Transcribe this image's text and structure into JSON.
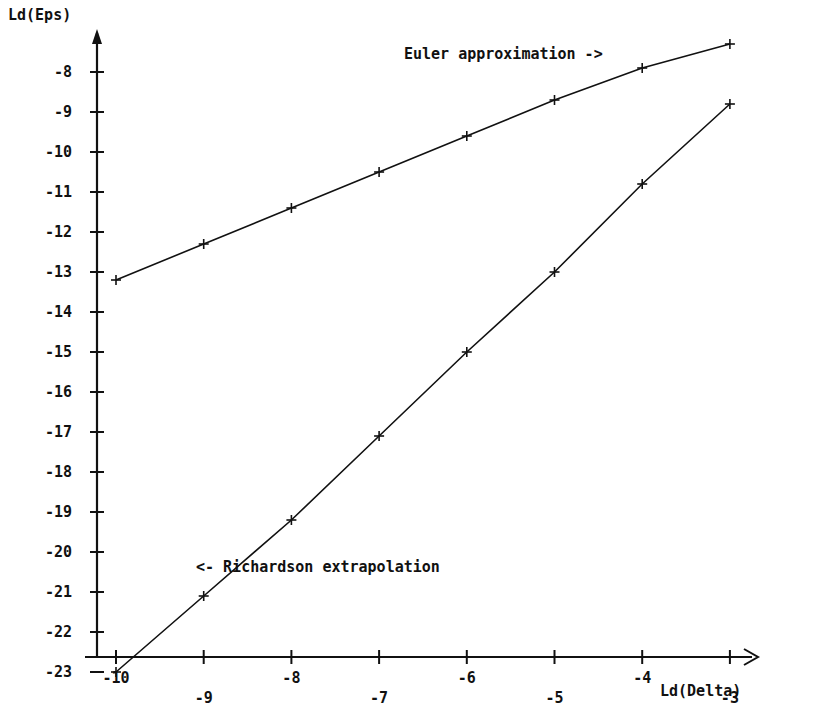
{
  "chart_data": {
    "type": "line",
    "title": "",
    "xlabel": "Ld(Delta)",
    "ylabel": "Ld(Eps)",
    "xlim": [
      -10.2,
      -2.7
    ],
    "ylim": [
      -23.4,
      -7.3
    ],
    "xticks": [
      -10,
      -9,
      -8,
      -7,
      -6,
      -5,
      -4,
      -3
    ],
    "xtick_labels": [
      "-10",
      "-9",
      "-8",
      "-7",
      "-6",
      "-5",
      "-4",
      "-3"
    ],
    "yticks": [
      -8,
      -9,
      -10,
      -11,
      -12,
      -13,
      -14,
      -15,
      -16,
      -17,
      -18,
      -19,
      -20,
      -21,
      -22,
      -23
    ],
    "ytick_labels": [
      "-8",
      "-9",
      "-10",
      "-11",
      "-12",
      "-13",
      "-14",
      "-15",
      "-16",
      "-17",
      "-18",
      "-19",
      "-20",
      "-21",
      "-22",
      "-23"
    ],
    "grid": false,
    "legend": "annotations",
    "x": [
      -10,
      -9,
      -8,
      -7,
      -6,
      -5,
      -4,
      -3
    ],
    "series": [
      {
        "name": "Euler approximation",
        "marker": "plus",
        "values": [
          -13.2,
          -12.3,
          -11.4,
          -10.5,
          -9.6,
          -8.7,
          -7.9,
          -7.3
        ]
      },
      {
        "name": "Richardson extrapolation",
        "marker": "plus",
        "values": [
          -23.0,
          -21.1,
          -19.2,
          -17.1,
          -15.0,
          -13.0,
          -10.8,
          -8.8
        ]
      }
    ],
    "annotations": [
      {
        "text": "Euler approximation ->",
        "x": -6.7,
        "y": -7.7
      },
      {
        "text": "<- Richardson extrapolation",
        "x": -9.1,
        "y": -21.2
      }
    ],
    "colors": {
      "line": "#111111",
      "axis": "#111111",
      "background": "#ffffff"
    }
  },
  "axes": {
    "y_title": "Ld(Eps)",
    "x_title": "Ld(Delta)"
  },
  "annotations": {
    "euler": "Euler approximation ->",
    "richardson": "<- Richardson extrapolation"
  }
}
